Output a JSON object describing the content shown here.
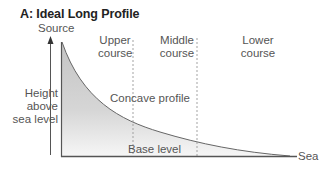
{
  "diagram": {
    "title": "A: Ideal Long Profile",
    "y_axis": {
      "top_label": "Source",
      "label_line1": "Height",
      "label_line2": "above",
      "label_line3": "sea level"
    },
    "sections": [
      {
        "line1": "Upper",
        "line2": "course"
      },
      {
        "line1": "Middle",
        "line2": "course"
      },
      {
        "line1": "Lower",
        "line2": "course"
      }
    ],
    "curve_label": "Concave profile",
    "base_label": "Base level",
    "end_label": "Sea",
    "colors": {
      "fill_top": "#c8c8c8",
      "fill_bottom": "#f4f4f4",
      "lines": "#555555",
      "dashes": "#999999"
    }
  }
}
